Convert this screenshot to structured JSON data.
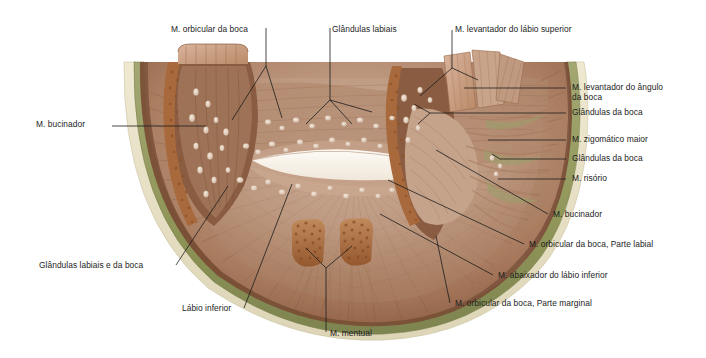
{
  "figure": {
    "type": "anatomical-illustration",
    "background_color": "#ffffff",
    "palette": {
      "outer_rim_cream": "#e8e2c9",
      "fascia_olive": "#9aa06a",
      "fascia_olive_dark": "#848a58",
      "muscle_brown_dark": "#6f4632",
      "muscle_brown": "#8a5a3f",
      "muscle_tan": "#b08368",
      "muscle_pink": "#c2a08c",
      "muscle_light": "#cbab97",
      "gland_nodule": "#e6d6c8",
      "cut_stump_granular": "#a8693d",
      "mouth_opening": "#f7f2ea",
      "leader_line": "#1d1d1d",
      "text": "#1d1d1d"
    }
  },
  "labels": [
    {
      "id": "m-orbicular-da-boca",
      "text": "M. orbicular da boca",
      "side": "top",
      "text_x": 171,
      "text_y": 24,
      "anchor": "start"
    },
    {
      "id": "glandulas-labiais",
      "text": "Glândulas labiais",
      "side": "top",
      "text_x": 332,
      "text_y": 24,
      "anchor": "start"
    },
    {
      "id": "m-levantador-do-labio-superior",
      "text": "M. levantador do lábio superior",
      "side": "top",
      "text_x": 455,
      "text_y": 24,
      "anchor": "start"
    },
    {
      "id": "m-bucinador-left",
      "text": "M. bucinador",
      "side": "left",
      "text_x": 36,
      "text_y": 123,
      "anchor": "start"
    },
    {
      "id": "m-levantador-do-angulo-da-boca",
      "text": "M. levantador do ângulo\nda boca",
      "side": "right",
      "text_x": 572,
      "text_y": 85,
      "anchor": "start",
      "lines": 2
    },
    {
      "id": "glandulas-da-boca-upper",
      "text": "Glândulas da boca",
      "side": "right",
      "text_x": 572,
      "text_y": 110,
      "anchor": "start"
    },
    {
      "id": "m-zigomatico-maior",
      "text": "M. zigomático maior",
      "side": "right",
      "text_x": 572,
      "text_y": 137,
      "anchor": "start"
    },
    {
      "id": "glandulas-da-boca-lower",
      "text": "Glândulas da boca",
      "side": "right",
      "text_x": 572,
      "text_y": 156,
      "anchor": "start"
    },
    {
      "id": "m-risorio",
      "text": "M. risório",
      "side": "right",
      "text_x": 572,
      "text_y": 176,
      "anchor": "start"
    },
    {
      "id": "m-bucinador-right",
      "text": "M. bucinador",
      "side": "right",
      "text_x": 553,
      "text_y": 216,
      "anchor": "start"
    },
    {
      "id": "m-orbicular-parte-labial",
      "text": "M. orbicular da boca, Parte labial",
      "side": "right",
      "text_x": 529,
      "text_y": 246,
      "anchor": "start"
    },
    {
      "id": "m-abaixador-do-labio-inferior",
      "text": "M. abaixador do lábio inferior",
      "side": "right",
      "text_x": 498,
      "text_y": 277,
      "anchor": "start"
    },
    {
      "id": "m-orbicular-parte-marginal",
      "text": "M. orbicular da boca, Parte marginal",
      "side": "right",
      "text_x": 455,
      "text_y": 305,
      "anchor": "start"
    },
    {
      "id": "glandulas-labiais-e-da-boca",
      "text": "Glândulas labiais e da boca",
      "side": "left",
      "text_x": 39,
      "text_y": 267,
      "anchor": "start"
    },
    {
      "id": "labio-inferior",
      "text": "Lábio inferior",
      "side": "bottom",
      "text_x": 182,
      "text_y": 313,
      "anchor": "start"
    },
    {
      "id": "m-mentual",
      "text": "M. mentual",
      "side": "bottom",
      "text_x": 330,
      "text_y": 335,
      "anchor": "start"
    }
  ],
  "structures": [
    {
      "id": "orbicularis-oris",
      "name": "M. orbicular da boca"
    },
    {
      "id": "labial-glands",
      "name": "Glândulas labiais"
    },
    {
      "id": "levator-labii-superioris",
      "name": "M. levantador do lábio superior"
    },
    {
      "id": "buccinator",
      "name": "M. bucinador"
    },
    {
      "id": "levator-anguli-oris",
      "name": "M. levantador do ângulo da boca"
    },
    {
      "id": "buccal-glands",
      "name": "Glândulas da boca"
    },
    {
      "id": "zygomaticus-major",
      "name": "M. zigomático maior"
    },
    {
      "id": "risorius",
      "name": "M. risório"
    },
    {
      "id": "orbicularis-labial-part",
      "name": "M. orbicular da boca, Parte labial"
    },
    {
      "id": "depressor-labii-inferioris",
      "name": "M. abaixador do lábio inferior"
    },
    {
      "id": "orbicularis-marginal-part",
      "name": "M. orbicular da boca, Parte marginal"
    },
    {
      "id": "lower-lip",
      "name": "Lábio inferior"
    },
    {
      "id": "mentalis",
      "name": "M. mentual"
    }
  ]
}
